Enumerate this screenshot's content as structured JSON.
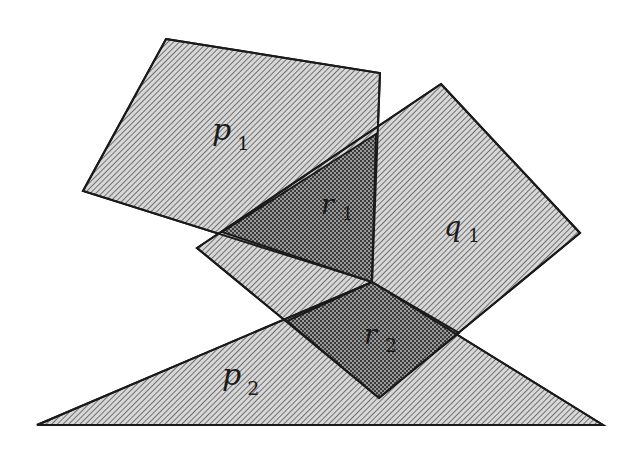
{
  "figure": {
    "width": 633,
    "height": 459,
    "background": "#ffffff",
    "stroke_color": "#1a1a1a",
    "hatch_fill": "#d8d8d8",
    "hatch_line": "#555555",
    "overlap_fill": "#9a9a9a",
    "overlap_dot": "#3a3a3a"
  },
  "polygons": [
    {
      "id": "p1",
      "kind": "quadrilateral",
      "points": "166,39 380,73 372,282 83,191"
    },
    {
      "id": "q1",
      "kind": "quadrilateral",
      "points": "441,84 580,233 379,398 197,248"
    },
    {
      "id": "p2",
      "kind": "triangle",
      "points": "372,282 603,425 37,425"
    }
  ],
  "intersections": [
    {
      "id": "r1",
      "of": [
        "p1",
        "q1"
      ],
      "points": "222,232 376,134 372,282"
    },
    {
      "id": "r2",
      "of": [
        "q1",
        "p2"
      ],
      "points": "372,282 459,333 379,398 287,321"
    }
  ],
  "labels": {
    "p1": {
      "base": "p",
      "sub": "1"
    },
    "q1": {
      "base": "q",
      "sub": "1"
    },
    "r1": {
      "base": "r",
      "sub": "1"
    },
    "r2": {
      "base": "r",
      "sub": "2"
    },
    "p2": {
      "base": "p",
      "sub": "2"
    }
  }
}
